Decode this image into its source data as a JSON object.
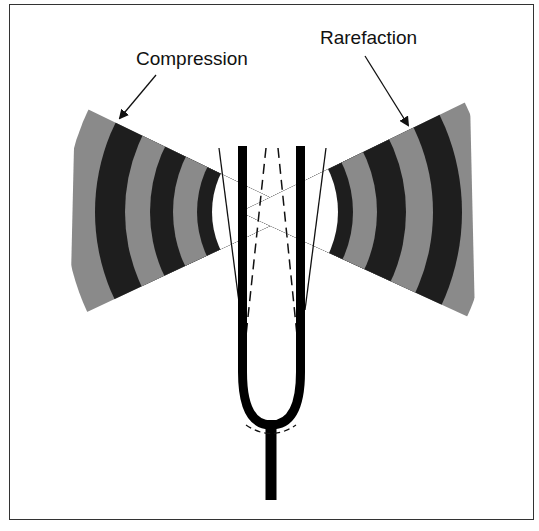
{
  "figure": {
    "labels": {
      "compression": "Compression",
      "rarefaction": "Rarefaction"
    },
    "colors": {
      "band_dark": "#1e1e1e",
      "band_light": "#8a8a8a",
      "fork": "#000000",
      "border": "#333333"
    },
    "elements": [
      "left-wave-fan",
      "right-wave-fan",
      "tuning-fork",
      "prong-displacement-lines"
    ]
  }
}
